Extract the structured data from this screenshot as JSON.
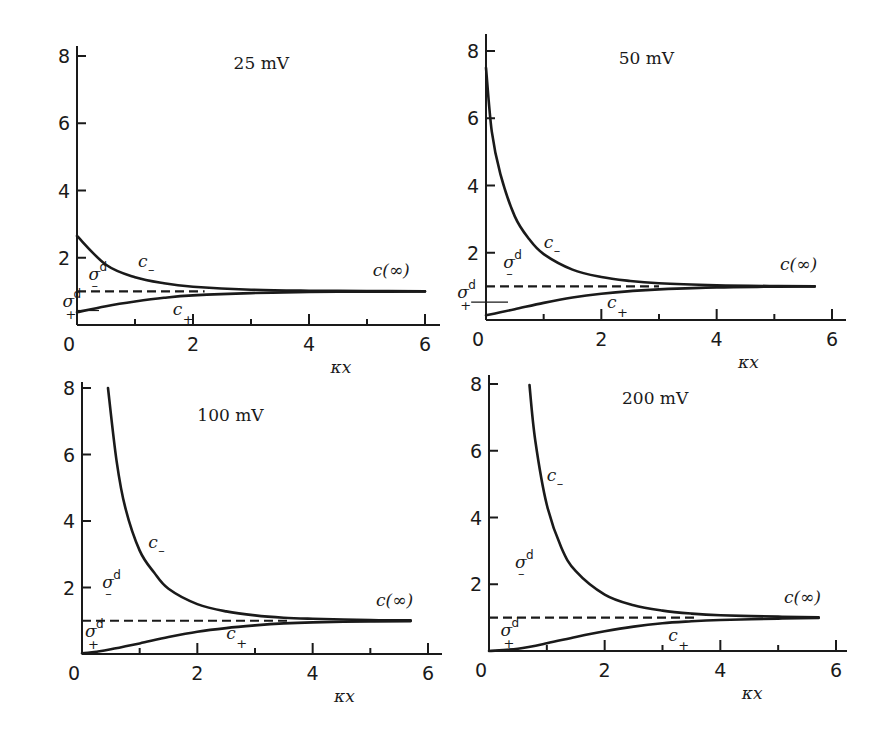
{
  "chart_data": [
    {
      "type": "line",
      "title": "25 mV",
      "xlabel": "κx",
      "ylabel": "",
      "xlim": [
        0,
        6.2
      ],
      "ylim": [
        0,
        8
      ],
      "xticks": [
        0,
        2,
        4,
        6
      ],
      "xminor": [
        1,
        3,
        5
      ],
      "yticks": [
        2,
        4,
        6,
        8
      ],
      "grid": false,
      "reference_level": 1.0,
      "reference_range": [
        0,
        2.2
      ],
      "annotations": {
        "c_minus": "c",
        "c_plus": "c",
        "c_inf": "c(∞)",
        "sigma_minus": "σ",
        "sigma_plus": "σ",
        "sup": "d",
        "minus": "–",
        "plus": "+"
      },
      "series": [
        {
          "name": "c_-",
          "x": [
            0,
            0.5,
            1,
            1.5,
            2,
            3,
            4,
            5,
            6
          ],
          "values": [
            2.65,
            1.79,
            1.42,
            1.24,
            1.14,
            1.05,
            1.02,
            1.01,
            1.0
          ]
        },
        {
          "name": "c_+",
          "x": [
            0,
            0.5,
            1,
            1.5,
            2,
            3,
            4,
            5,
            6
          ],
          "values": [
            0.38,
            0.56,
            0.7,
            0.81,
            0.88,
            0.95,
            0.98,
            0.99,
            1.0
          ]
        }
      ],
      "label_pos": {
        "title": [
          2.7,
          7.6
        ],
        "c_minus": [
          1.05,
          1.72
        ],
        "c_plus": [
          1.65,
          0.3
        ],
        "c_inf": [
          5.1,
          1.45
        ],
        "sigma_minus": [
          0.2,
          1.35
        ],
        "sigma_plus": [
          -0.25,
          0.55
        ]
      }
    },
    {
      "type": "line",
      "title": "50 mV",
      "xlabel": "κx",
      "ylabel": "",
      "xlim": [
        0,
        6.2
      ],
      "ylim": [
        0,
        8
      ],
      "xticks": [
        0,
        2,
        4,
        6
      ],
      "xminor": [
        1,
        3,
        5
      ],
      "yticks": [
        2,
        4,
        6,
        8
      ],
      "grid": false,
      "reference_level": 1.0,
      "reference_range": [
        0,
        3.0
      ],
      "annotations": {
        "c_minus": "c",
        "c_plus": "c",
        "c_inf": "c(∞)",
        "sigma_minus": "σ",
        "sigma_plus": "σ",
        "sup": "d",
        "minus": "–",
        "plus": "+"
      },
      "series": [
        {
          "name": "c_-",
          "x": [
            0,
            0.1,
            0.25,
            0.5,
            0.75,
            1,
            1.5,
            2,
            2.5,
            3,
            4,
            5,
            5.7
          ],
          "values": [
            7.5,
            5.6,
            4.34,
            3.08,
            2.4,
            1.96,
            1.5,
            1.28,
            1.16,
            1.09,
            1.03,
            1.01,
            1.0
          ]
        },
        {
          "name": "c_+",
          "x": [
            0,
            0.25,
            0.5,
            1,
            1.5,
            2,
            2.5,
            3,
            4,
            5,
            5.7
          ],
          "values": [
            0.14,
            0.23,
            0.32,
            0.51,
            0.67,
            0.78,
            0.86,
            0.91,
            0.97,
            0.99,
            1.0
          ]
        }
      ],
      "label_pos": {
        "title": [
          2.3,
          7.6
        ],
        "c_minus": [
          1.0,
          2.15
        ],
        "c_plus": [
          2.1,
          0.35
        ],
        "c_inf": [
          5.1,
          1.5
        ],
        "sigma_minus": [
          0.3,
          1.55
        ],
        "sigma_plus": [
          -0.5,
          0.65
        ]
      }
    },
    {
      "type": "line",
      "title": "100 mV",
      "xlabel": "κx",
      "ylabel": "",
      "xlim": [
        0,
        6.2
      ],
      "ylim": [
        0,
        8
      ],
      "xticks": [
        0,
        2,
        4,
        6
      ],
      "xminor": [
        1,
        3,
        5
      ],
      "yticks": [
        2,
        4,
        6,
        8
      ],
      "grid": false,
      "reference_level": 1.0,
      "reference_range": [
        0,
        3.6
      ],
      "annotations": {
        "c_minus": "c",
        "c_plus": "c",
        "c_inf": "c(∞)",
        "sigma_minus": "σ",
        "sigma_plus": "σ",
        "sup": "d",
        "minus": "–",
        "plus": "+"
      },
      "series": [
        {
          "name": "c_-",
          "x": [
            0.45,
            0.6,
            0.75,
            1,
            1.25,
            1.5,
            2,
            2.5,
            3,
            3.5,
            4,
            5,
            5.7
          ],
          "values": [
            8.0,
            5.8,
            4.4,
            3.11,
            2.45,
            1.96,
            1.5,
            1.28,
            1.16,
            1.09,
            1.06,
            1.02,
            1.01
          ]
        },
        {
          "name": "c_+",
          "x": [
            0,
            0.25,
            0.5,
            1,
            1.5,
            2,
            2.5,
            3,
            3.5,
            4,
            5,
            5.7
          ],
          "values": [
            0.02,
            0.07,
            0.14,
            0.32,
            0.51,
            0.67,
            0.78,
            0.86,
            0.92,
            0.95,
            0.98,
            0.99
          ]
        }
      ],
      "label_pos": {
        "title": [
          2.0,
          7.0
        ],
        "c_minus": [
          1.15,
          3.2
        ],
        "c_plus": [
          2.5,
          0.45
        ],
        "c_inf": [
          5.1,
          1.45
        ],
        "sigma_minus": [
          0.35,
          2.0
        ],
        "sigma_plus": [
          0.05,
          0.5
        ]
      }
    },
    {
      "type": "line",
      "title": "200 mV",
      "xlabel": "κx",
      "ylabel": "",
      "xlim": [
        0,
        6.2
      ],
      "ylim": [
        0,
        8
      ],
      "xticks": [
        0,
        2,
        4,
        6
      ],
      "xminor": [
        1,
        3,
        5
      ],
      "yticks": [
        2,
        4,
        6,
        8
      ],
      "grid": false,
      "reference_level": 1.0,
      "reference_range": [
        0,
        3.6
      ],
      "annotations": {
        "c_minus": "c",
        "c_plus": "c",
        "c_inf": "c(∞)",
        "sigma_minus": "σ",
        "sigma_plus": "σ",
        "sup": "d",
        "minus": "–",
        "plus": "+"
      },
      "series": [
        {
          "name": "c_-",
          "x": [
            0.7,
            0.8,
            1,
            1.25,
            1.5,
            2,
            2.5,
            3,
            3.5,
            4,
            5,
            5.7
          ],
          "values": [
            7.97,
            6.3,
            4.38,
            3.1,
            2.39,
            1.69,
            1.37,
            1.21,
            1.12,
            1.07,
            1.03,
            1.01
          ]
        },
        {
          "name": "c_+",
          "x": [
            0,
            0.5,
            1,
            1.5,
            2,
            2.5,
            3,
            3.5,
            4,
            5,
            5.7
          ],
          "values": [
            0.0,
            0.07,
            0.23,
            0.42,
            0.59,
            0.73,
            0.83,
            0.89,
            0.93,
            0.97,
            0.99
          ]
        }
      ],
      "label_pos": {
        "title": [
          2.3,
          7.4
        ],
        "c_minus": [
          1.0,
          5.1
        ],
        "c_plus": [
          3.1,
          0.3
        ],
        "c_inf": [
          5.1,
          1.45
        ],
        "sigma_minus": [
          0.45,
          2.5
        ],
        "sigma_plus": [
          0.2,
          0.45
        ]
      }
    }
  ]
}
